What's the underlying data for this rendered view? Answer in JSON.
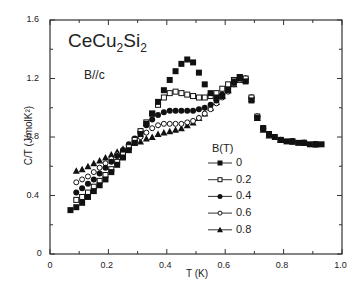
{
  "chart_data": {
    "type": "scatter",
    "title": "CeCu2Si2",
    "annotation": "B//c",
    "xlabel": "T (K)",
    "ylabel": "C/T (J/molK²)",
    "xlim": [
      0,
      1.0
    ],
    "ylim": [
      0,
      1.6
    ],
    "x_ticks": [
      "0",
      "0.2",
      "0.4",
      "0.6",
      "0.8",
      "1.0"
    ],
    "y_ticks": [
      "0",
      "0.4",
      "0.8",
      "1.2",
      "1.6"
    ],
    "grid": false,
    "legend_title": "B(T)",
    "legend_position": "center-right",
    "series": [
      {
        "name": "0",
        "marker": "filled-square",
        "x": [
          0.07,
          0.09,
          0.11,
          0.13,
          0.15,
          0.17,
          0.19,
          0.21,
          0.23,
          0.25,
          0.27,
          0.29,
          0.31,
          0.33,
          0.35,
          0.37,
          0.39,
          0.41,
          0.43,
          0.45,
          0.47,
          0.49,
          0.51,
          0.53,
          0.55,
          0.57,
          0.59,
          0.61,
          0.63,
          0.65,
          0.67,
          0.69,
          0.71,
          0.73,
          0.75,
          0.77,
          0.79,
          0.81,
          0.83,
          0.85,
          0.87,
          0.89,
          0.91,
          0.93
        ],
        "y": [
          0.3,
          0.32,
          0.35,
          0.39,
          0.43,
          0.47,
          0.51,
          0.56,
          0.61,
          0.66,
          0.71,
          0.76,
          0.82,
          0.89,
          0.96,
          1.04,
          1.12,
          1.19,
          1.25,
          1.3,
          1.33,
          1.31,
          1.24,
          1.16,
          1.1,
          1.07,
          1.08,
          1.12,
          1.18,
          1.21,
          1.18,
          1.05,
          0.93,
          0.86,
          0.82,
          0.8,
          0.78,
          0.77,
          0.77,
          0.76,
          0.76,
          0.75,
          0.75,
          0.75
        ]
      },
      {
        "name": "0.2",
        "marker": "open-square",
        "x": [
          0.09,
          0.11,
          0.13,
          0.15,
          0.17,
          0.19,
          0.21,
          0.23,
          0.25,
          0.27,
          0.29,
          0.31,
          0.33,
          0.35,
          0.37,
          0.39,
          0.41,
          0.43,
          0.45,
          0.47,
          0.49,
          0.51,
          0.53,
          0.55,
          0.57,
          0.59,
          0.61,
          0.63,
          0.65,
          0.67,
          0.69,
          0.71,
          0.73,
          0.75,
          0.79,
          0.83,
          0.87,
          0.91
        ],
        "y": [
          0.37,
          0.39,
          0.42,
          0.46,
          0.5,
          0.54,
          0.58,
          0.63,
          0.68,
          0.73,
          0.78,
          0.84,
          0.9,
          0.96,
          1.02,
          1.07,
          1.1,
          1.11,
          1.1,
          1.09,
          1.08,
          1.07,
          1.07,
          1.08,
          1.1,
          1.13,
          1.16,
          1.19,
          1.21,
          1.2,
          1.07,
          0.94,
          0.86,
          0.82,
          0.78,
          0.77,
          0.76,
          0.75
        ]
      },
      {
        "name": "0.4",
        "marker": "filled-circle",
        "x": [
          0.09,
          0.11,
          0.13,
          0.15,
          0.17,
          0.19,
          0.21,
          0.23,
          0.25,
          0.27,
          0.29,
          0.31,
          0.33,
          0.35,
          0.37,
          0.39,
          0.41,
          0.43,
          0.45,
          0.47,
          0.49,
          0.51,
          0.53,
          0.55,
          0.57,
          0.59,
          0.61,
          0.63,
          0.65,
          0.67,
          0.69,
          0.71,
          0.73,
          0.75,
          0.79,
          0.83,
          0.87,
          0.91
        ],
        "y": [
          0.42,
          0.45,
          0.48,
          0.51,
          0.55,
          0.59,
          0.63,
          0.67,
          0.71,
          0.75,
          0.79,
          0.84,
          0.88,
          0.92,
          0.95,
          0.97,
          0.98,
          0.98,
          0.98,
          0.98,
          0.98,
          0.99,
          1.0,
          1.02,
          1.05,
          1.09,
          1.13,
          1.17,
          1.2,
          1.2,
          1.07,
          0.94,
          0.86,
          0.82,
          0.78,
          0.77,
          0.76,
          0.75
        ]
      },
      {
        "name": "0.6",
        "marker": "open-circle",
        "x": [
          0.09,
          0.11,
          0.13,
          0.15,
          0.17,
          0.19,
          0.21,
          0.23,
          0.25,
          0.27,
          0.29,
          0.31,
          0.33,
          0.35,
          0.37,
          0.39,
          0.41,
          0.43,
          0.45,
          0.47,
          0.49,
          0.51,
          0.53,
          0.55,
          0.57,
          0.59,
          0.61,
          0.63,
          0.65,
          0.67,
          0.69,
          0.71,
          0.73,
          0.75,
          0.79,
          0.83,
          0.87,
          0.91
        ],
        "y": [
          0.49,
          0.51,
          0.53,
          0.56,
          0.59,
          0.62,
          0.65,
          0.68,
          0.71,
          0.74,
          0.77,
          0.8,
          0.83,
          0.86,
          0.88,
          0.89,
          0.89,
          0.89,
          0.89,
          0.9,
          0.91,
          0.93,
          0.96,
          0.99,
          1.03,
          1.07,
          1.11,
          1.16,
          1.19,
          1.2,
          1.07,
          0.94,
          0.86,
          0.82,
          0.78,
          0.77,
          0.76,
          0.75
        ]
      },
      {
        "name": "0.8",
        "marker": "filled-triangle",
        "x": [
          0.09,
          0.11,
          0.13,
          0.15,
          0.17,
          0.19,
          0.21,
          0.23,
          0.25,
          0.27,
          0.29,
          0.31,
          0.33,
          0.35,
          0.37,
          0.39,
          0.41,
          0.43,
          0.45,
          0.47,
          0.49,
          0.51,
          0.53,
          0.55,
          0.57,
          0.59,
          0.61,
          0.63,
          0.65,
          0.67,
          0.69,
          0.71,
          0.73,
          0.75,
          0.79,
          0.83,
          0.87,
          0.91
        ],
        "y": [
          0.57,
          0.58,
          0.6,
          0.62,
          0.64,
          0.66,
          0.68,
          0.7,
          0.72,
          0.74,
          0.76,
          0.77,
          0.79,
          0.8,
          0.82,
          0.83,
          0.84,
          0.85,
          0.86,
          0.88,
          0.9,
          0.93,
          0.96,
          1.0,
          1.04,
          1.08,
          1.12,
          1.16,
          1.19,
          1.19,
          1.06,
          0.93,
          0.85,
          0.81,
          0.78,
          0.77,
          0.76,
          0.75
        ]
      }
    ]
  }
}
